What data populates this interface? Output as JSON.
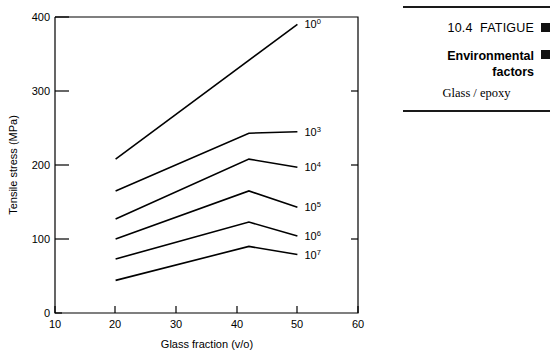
{
  "figure": {
    "axes": {
      "xlabel": "Glass fraction (v/o)",
      "ylabel": "Tensile stress (MPa)",
      "xticks": [
        "10",
        "20",
        "30",
        "40",
        "50",
        "60"
      ],
      "yticks": [
        "0",
        "100",
        "200",
        "300",
        "400"
      ]
    },
    "curve_labels": [
      {
        "base": "10",
        "exp": "0"
      },
      {
        "base": "10",
        "exp": "3"
      },
      {
        "base": "10",
        "exp": "4"
      },
      {
        "base": "10",
        "exp": "5"
      },
      {
        "base": "10",
        "exp": "6"
      },
      {
        "base": "10",
        "exp": "7"
      }
    ]
  },
  "sidebar": {
    "section_number": "10.4",
    "section_title": "FATIGUE",
    "subsection_title": "Environmental factors",
    "caption": "Glass / epoxy",
    "marker_color": "#111111",
    "rule_color": "#1a1a1a"
  },
  "chart_data": {
    "type": "line",
    "title": "",
    "xlabel": "Glass fraction (v/o)",
    "ylabel": "Tensile stress (MPa)",
    "xlim": [
      10,
      60
    ],
    "ylim": [
      0,
      400
    ],
    "xticks": [
      10,
      20,
      30,
      40,
      50,
      60
    ],
    "yticks": [
      0,
      100,
      200,
      300,
      400
    ],
    "grid": false,
    "legend": "inline-right-end-labels",
    "series": [
      {
        "name": "10^0",
        "label": "10⁰",
        "x": [
          20,
          50
        ],
        "y": [
          208,
          390
        ]
      },
      {
        "name": "10^3",
        "label": "10³",
        "x": [
          20,
          42,
          50
        ],
        "y": [
          165,
          243,
          245
        ]
      },
      {
        "name": "10^4",
        "label": "10⁴",
        "x": [
          20,
          42,
          50
        ],
        "y": [
          127,
          208,
          197
        ]
      },
      {
        "name": "10^5",
        "label": "10⁵",
        "x": [
          20,
          42,
          50
        ],
        "y": [
          100,
          165,
          143
        ]
      },
      {
        "name": "10^6",
        "label": "10⁶",
        "x": [
          20,
          42,
          50
        ],
        "y": [
          73,
          123,
          104
        ]
      },
      {
        "name": "10^7",
        "label": "10⁷",
        "x": [
          20,
          42,
          50
        ],
        "y": [
          44,
          90,
          79
        ]
      }
    ]
  }
}
